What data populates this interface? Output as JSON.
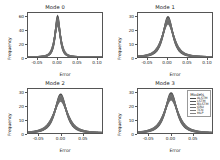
{
  "figure": {
    "background": "#ffffff",
    "axis_color": "#555555",
    "text_color": "#222222"
  },
  "legend": {
    "title": "Models",
    "entries": [
      {
        "label": "ALSTM",
        "color": "#4a4a4a"
      },
      {
        "label": "LSTM",
        "color": "#5a5a5a"
      },
      {
        "label": "BiLSTM",
        "color": "#666666"
      },
      {
        "label": "GRU",
        "color": "#707070"
      },
      {
        "label": "TCN",
        "color": "#7a7a7a"
      },
      {
        "label": "MLP",
        "color": "#858585"
      }
    ]
  },
  "chart_data": [
    {
      "type": "line",
      "title": "Mode 0",
      "xlabel": "Error",
      "ylabel": "Frequency",
      "xlim": [
        -0.075,
        0.115
      ],
      "ylim": [
        0,
        66
      ],
      "xticks": [
        -0.05,
        0.0,
        0.05,
        0.1
      ],
      "xticklabels": [
        "-0.05",
        "0.00",
        "0.05",
        "0.10"
      ],
      "yticks": [
        0,
        20,
        40,
        60
      ],
      "yticklabels": [
        "0",
        "20",
        "40",
        "60"
      ],
      "grid": false,
      "legend_position": "none",
      "series": [
        {
          "name": "ALSTM",
          "peak": 61,
          "center": 0.001,
          "width": 0.0052
        },
        {
          "name": "LSTM",
          "peak": 58,
          "center": 0.001,
          "width": 0.0056
        },
        {
          "name": "BiLSTM",
          "peak": 56,
          "center": 0.001,
          "width": 0.0059
        },
        {
          "name": "GRU",
          "peak": 54,
          "center": 0.001,
          "width": 0.0062
        },
        {
          "name": "TCN",
          "peak": 51,
          "center": 0.001,
          "width": 0.0066
        },
        {
          "name": "MLP",
          "peak": 48,
          "center": 0.001,
          "width": 0.007
        }
      ]
    },
    {
      "type": "line",
      "title": "Mode 1",
      "xlabel": "Error",
      "ylabel": "Frequency",
      "xlim": [
        -0.075,
        0.115
      ],
      "ylim": [
        0,
        33
      ],
      "xticks": [
        -0.05,
        0.0,
        0.05,
        0.1
      ],
      "xticklabels": [
        "-0.05",
        "0.00",
        "0.05",
        "0.10"
      ],
      "yticks": [
        0,
        10,
        20,
        30
      ],
      "yticklabels": [
        "0",
        "10",
        "20",
        "30"
      ],
      "grid": false,
      "legend_position": "none",
      "series": [
        {
          "name": "ALSTM",
          "peak": 30,
          "center": 0.002,
          "width": 0.0105
        },
        {
          "name": "LSTM",
          "peak": 29,
          "center": 0.002,
          "width": 0.0112
        },
        {
          "name": "BiLSTM",
          "peak": 28,
          "center": 0.002,
          "width": 0.0118
        },
        {
          "name": "GRU",
          "peak": 27,
          "center": 0.002,
          "width": 0.0124
        },
        {
          "name": "TCN",
          "peak": 26,
          "center": 0.002,
          "width": 0.013
        },
        {
          "name": "MLP",
          "peak": 25,
          "center": 0.002,
          "width": 0.0137
        }
      ]
    },
    {
      "type": "line",
      "title": "Mode 2",
      "xlabel": "Error",
      "ylabel": "Frequency",
      "xlim": [
        -0.075,
        0.095
      ],
      "ylim": [
        0,
        33
      ],
      "xticks": [
        -0.05,
        0.0,
        0.05
      ],
      "xticklabels": [
        "-0.05",
        "0.00",
        "0.05"
      ],
      "yticks": [
        0,
        10,
        20,
        30
      ],
      "yticklabels": [
        "0",
        "10",
        "20",
        "30"
      ],
      "grid": false,
      "legend_position": "none",
      "series": [
        {
          "name": "ALSTM",
          "peak": 29,
          "center": 0.0,
          "width": 0.011
        },
        {
          "name": "LSTM",
          "peak": 28,
          "center": 0.0,
          "width": 0.0117
        },
        {
          "name": "BiLSTM",
          "peak": 27,
          "center": 0.0,
          "width": 0.0123
        },
        {
          "name": "GRU",
          "peak": 26,
          "center": 0.0,
          "width": 0.013
        },
        {
          "name": "TCN",
          "peak": 25,
          "center": 0.0,
          "width": 0.0137
        },
        {
          "name": "MLP",
          "peak": 24,
          "center": 0.0,
          "width": 0.0144
        }
      ]
    },
    {
      "type": "line",
      "title": "Mode 3",
      "xlabel": "Error",
      "ylabel": "Frequency",
      "xlim": [
        -0.075,
        0.095
      ],
      "ylim": [
        0,
        33
      ],
      "xticks": [
        -0.05,
        0.0,
        0.05
      ],
      "xticklabels": [
        "-0.05",
        "0.00",
        "0.05"
      ],
      "yticks": [
        0,
        10,
        20,
        30
      ],
      "yticklabels": [
        "0",
        "10",
        "20",
        "30"
      ],
      "grid": false,
      "legend_position": "upper right",
      "series": [
        {
          "name": "ALSTM",
          "peak": 30,
          "center": 0.001,
          "width": 0.0112
        },
        {
          "name": "LSTM",
          "peak": 29,
          "center": 0.001,
          "width": 0.0118
        },
        {
          "name": "BiLSTM",
          "peak": 28,
          "center": 0.001,
          "width": 0.0125
        },
        {
          "name": "GRU",
          "peak": 27,
          "center": 0.001,
          "width": 0.0132
        },
        {
          "name": "TCN",
          "peak": 26,
          "center": 0.001,
          "width": 0.0139
        },
        {
          "name": "MLP",
          "peak": 25,
          "center": 0.001,
          "width": 0.0146
        }
      ]
    }
  ]
}
